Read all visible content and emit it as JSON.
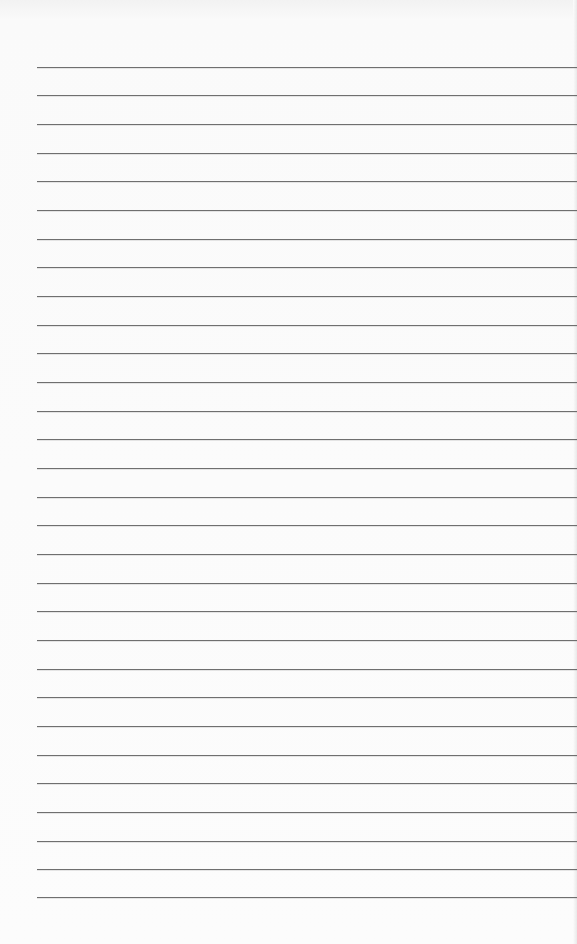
{
  "paper": {
    "type": "ruled-notebook-page",
    "background_color": "#fbfbfb",
    "line_color": "#6f6f6f",
    "line_left_px": 37,
    "line_count": 30,
    "line_positions_y": [
      67,
      95,
      124,
      153,
      181,
      210,
      239,
      267,
      296,
      325,
      353,
      382,
      411,
      439,
      468,
      497,
      525,
      554,
      583,
      611,
      640,
      669,
      697,
      726,
      755,
      783,
      812,
      841,
      869,
      897
    ]
  }
}
